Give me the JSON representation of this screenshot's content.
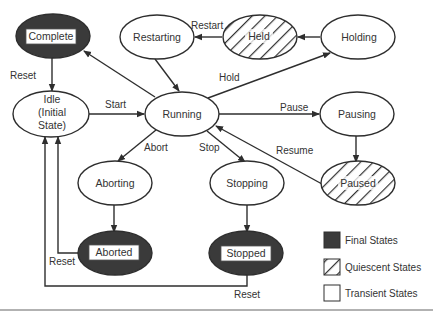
{
  "diagram": {
    "type": "state-machine",
    "states": {
      "complete": {
        "label": "Complete",
        "kind": "final"
      },
      "restarting": {
        "label": "Restarting",
        "kind": "transient"
      },
      "held": {
        "label": "Held",
        "kind": "quiescent"
      },
      "holding": {
        "label": "Holding",
        "kind": "transient"
      },
      "idle": {
        "label_lines": [
          "Idle",
          "(Initial",
          "State)"
        ],
        "kind": "transient"
      },
      "running": {
        "label": "Running",
        "kind": "transient"
      },
      "pausing": {
        "label": "Pausing",
        "kind": "transient"
      },
      "aborting": {
        "label": "Aborting",
        "kind": "transient"
      },
      "stopping": {
        "label": "Stopping",
        "kind": "transient"
      },
      "paused": {
        "label": "Paused",
        "kind": "quiescent"
      },
      "aborted": {
        "label": "Aborted",
        "kind": "final"
      },
      "stopped": {
        "label": "Stopped",
        "kind": "final"
      }
    },
    "transitions": {
      "reset_complete": {
        "label": "Reset",
        "from": "Complete",
        "to": "Idle"
      },
      "start": {
        "label": "Start",
        "from": "Idle",
        "to": "Running"
      },
      "restart": {
        "label": "Restart",
        "from": "Held",
        "to": "Restarting"
      },
      "hold": {
        "label": "Hold",
        "from": "Running",
        "to": "Holding"
      },
      "pause": {
        "label": "Pause",
        "from": "Running",
        "to": "Pausing"
      },
      "resume": {
        "label": "Resume",
        "from": "Paused",
        "to": "Running"
      },
      "abort": {
        "label": "Abort",
        "from": "Running",
        "to": "Aborting"
      },
      "stop": {
        "label": "Stop",
        "from": "Running",
        "to": "Stopping"
      },
      "reset_aborted": {
        "label": "Reset",
        "from": "Aborted",
        "to": "Idle"
      },
      "reset_stopped": {
        "label": "Reset",
        "from": "Stopped",
        "to": "Idle"
      }
    },
    "legend": {
      "final": "Final States",
      "quiescent": "Quiescent States",
      "transient": "Transient States"
    },
    "colors": {
      "final_fill": "#3a3a3a",
      "stroke": "#2e2e2e",
      "text": "#333333",
      "background": "#ffffff"
    }
  }
}
